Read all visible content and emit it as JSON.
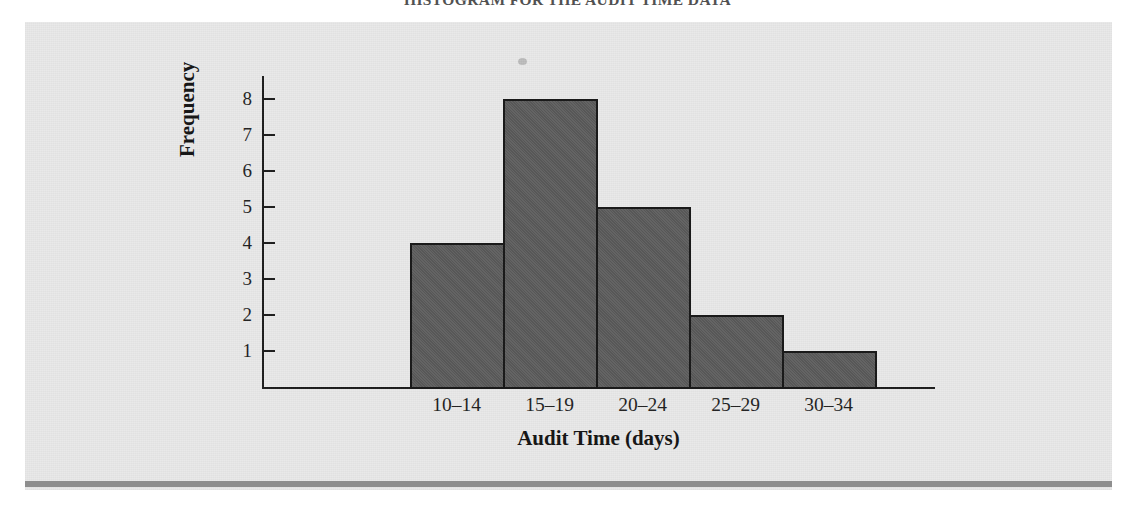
{
  "figure": {
    "caption": "HISTOGRAM FOR THE AUDIT TIME DATA",
    "panel_background": "#e9e9e9",
    "rule_color": "#8e8e8e"
  },
  "chart_data": {
    "type": "bar",
    "title": "HISTOGRAM FOR THE AUDIT TIME DATA",
    "categories": [
      "10–14",
      "15–19",
      "20–24",
      "25–29",
      "30–34"
    ],
    "values": [
      4,
      8,
      5,
      2,
      1
    ],
    "xlabel": "Audit Time (days)",
    "ylabel": "Frequency",
    "ylim": [
      0,
      8
    ],
    "ytick_labels": [
      "8",
      "7",
      "6",
      "5",
      "4",
      "3",
      "2",
      "1"
    ],
    "ytick_values": [
      8,
      7,
      6,
      5,
      4,
      3,
      2,
      1
    ],
    "grid": false,
    "legend": false,
    "bar_gap": 0,
    "bar_fill_color": "#5c5c5c",
    "bar_edge_color": "#1a1a1a",
    "axis_color": "#1c1c1c"
  }
}
